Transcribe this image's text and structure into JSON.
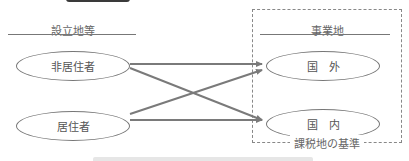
{
  "diagram": {
    "left_column": {
      "heading": "設立地等",
      "nodes": [
        {
          "id": "non-resident",
          "label": "非居住者"
        },
        {
          "id": "resident",
          "label": "居住者"
        }
      ]
    },
    "right_column": {
      "heading": "事業地",
      "nodes": [
        {
          "id": "overseas",
          "label": "国　外"
        },
        {
          "id": "domestic",
          "label": "国　内"
        }
      ],
      "group_label": "課税地の基準"
    },
    "edges": [
      {
        "from": "non-resident",
        "to": "overseas"
      },
      {
        "from": "non-resident",
        "to": "domestic"
      },
      {
        "from": "resident",
        "to": "overseas"
      },
      {
        "from": "resident",
        "to": "domestic"
      }
    ],
    "colors": {
      "arrow": "#7a7a7a",
      "outline": "#777777",
      "text": "#555555",
      "top_tab": "#3a3a3a"
    }
  }
}
